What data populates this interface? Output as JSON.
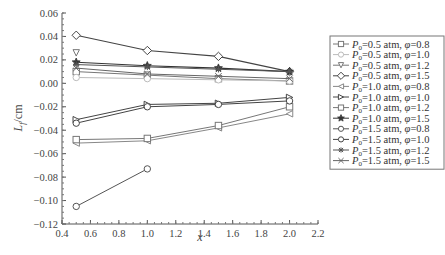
{
  "chart_data": {
    "type": "line",
    "title": "",
    "xlabel": "x",
    "ylabel": "L_f/cm",
    "xlim": [
      0.4,
      2.2
    ],
    "ylim": [
      -0.12,
      0.06
    ],
    "x_ticks": [
      "0.4",
      "0.6",
      "0.8",
      "1.0",
      "1.2",
      "1.4",
      "1.6",
      "1.8",
      "2.0",
      "2.2"
    ],
    "y_ticks": [
      "0.06",
      "0.04",
      "0.02",
      "0.00",
      "−0.02",
      "−0.04",
      "−0.06",
      "−0.08",
      "−0.10",
      "−0.12"
    ],
    "grid": false,
    "legend_position": "right",
    "series": [
      {
        "name": "P0=0.5 atm, φ=0.8",
        "label_p": "=0.5 atm, ",
        "label_phi": "=0.8",
        "marker": "square",
        "color": "#777777",
        "x": [
          0.5,
          1.0,
          1.5,
          2.0
        ],
        "values": [
          0.01,
          0.007,
          0.004,
          0.002
        ]
      },
      {
        "name": "P0=0.5 atm, φ=1.0",
        "label_p": "=0.5 atm, ",
        "label_phi": "=1.0",
        "marker": "circle",
        "color": "#bbbbbb",
        "x": [
          0.5,
          1.0,
          1.5,
          2.0
        ],
        "values": [
          0.005,
          0.004,
          0.003,
          0.002
        ]
      },
      {
        "name": "P0=0.5 atm, φ=1.2",
        "label_p": "=0.5 atm, ",
        "label_phi": "=1.2",
        "marker": "triangle-down",
        "color": "#777777",
        "x": [
          0.5
        ],
        "values": [
          0.026
        ]
      },
      {
        "name": "P0=0.5 atm, φ=1.5",
        "label_p": "=0.5 atm, ",
        "label_phi": "=1.5",
        "marker": "diamond",
        "color": "#444444",
        "x": [
          0.5,
          1.0,
          1.5,
          2.0
        ],
        "values": [
          0.041,
          0.028,
          0.023,
          0.01
        ]
      },
      {
        "name": "P0=1.0 atm, φ=0.8",
        "label_p": "=1.0 atm, ",
        "label_phi": "=0.8",
        "marker": "triangle-left",
        "color": "#888888",
        "x": [
          0.5,
          1.0,
          1.5,
          2.0
        ],
        "values": [
          -0.051,
          -0.049,
          -0.038,
          -0.026
        ]
      },
      {
        "name": "P0=1.0 atm, φ=1.0",
        "label_p": "=1.0 atm, ",
        "label_phi": "=1.0",
        "marker": "triangle-right",
        "color": "#444444",
        "x": [
          0.5,
          1.0,
          1.5,
          2.0
        ],
        "values": [
          -0.031,
          -0.018,
          -0.017,
          -0.012
        ]
      },
      {
        "name": "P0=1.0 atm, φ=1.2",
        "label_p": "=1.0 atm, ",
        "label_phi": "=1.2",
        "marker": "square",
        "color": "#777777",
        "x": [
          0.5,
          1.0,
          1.5,
          2.0
        ],
        "values": [
          -0.048,
          -0.047,
          -0.036,
          -0.02
        ]
      },
      {
        "name": "P0=1.0 atm, φ=1.5",
        "label_p": "=1.0 atm, ",
        "label_phi": "=1.5",
        "marker": "star",
        "color": "#333333",
        "x": [
          0.5,
          1.0,
          1.5,
          2.0
        ],
        "values": [
          0.018,
          0.015,
          0.013,
          0.01
        ]
      },
      {
        "name": "P0=1.5 atm, φ=0.8",
        "label_p": "=1.5 atm, ",
        "label_phi": "=0.8",
        "marker": "circle",
        "color": "#555555",
        "x": [
          0.5,
          1.0
        ],
        "values": [
          -0.105,
          -0.073
        ]
      },
      {
        "name": "P0=1.5 atm, φ=1.0",
        "label_p": "=1.5 atm, ",
        "label_phi": "=1.0",
        "marker": "circle",
        "color": "#444444",
        "x": [
          0.5,
          1.0,
          1.5,
          2.0
        ],
        "values": [
          -0.034,
          -0.02,
          -0.018,
          -0.015
        ]
      },
      {
        "name": "P0=1.5 atm, φ=1.2",
        "label_p": "=1.5 atm, ",
        "label_phi": "=1.2",
        "marker": "asterisk",
        "color": "#555555",
        "x": [
          0.5,
          1.0,
          1.5,
          2.0
        ],
        "values": [
          0.016,
          0.014,
          0.012,
          0.01
        ]
      },
      {
        "name": "P0=1.5 atm, φ=1.5",
        "label_p": "=1.5 atm, ",
        "label_phi": "=1.5",
        "marker": "x-cross",
        "color": "#666666",
        "x": [
          0.5,
          1.0,
          1.5,
          2.0
        ],
        "values": [
          0.013,
          0.008,
          0.006,
          0.004
        ]
      }
    ]
  },
  "labels": {
    "p_symbol": "P",
    "p_subscript": "0",
    "phi_symbol": "φ",
    "y_axis_main": "L",
    "y_axis_sub": "f",
    "y_axis_unit": "/cm",
    "x_axis": "x"
  }
}
